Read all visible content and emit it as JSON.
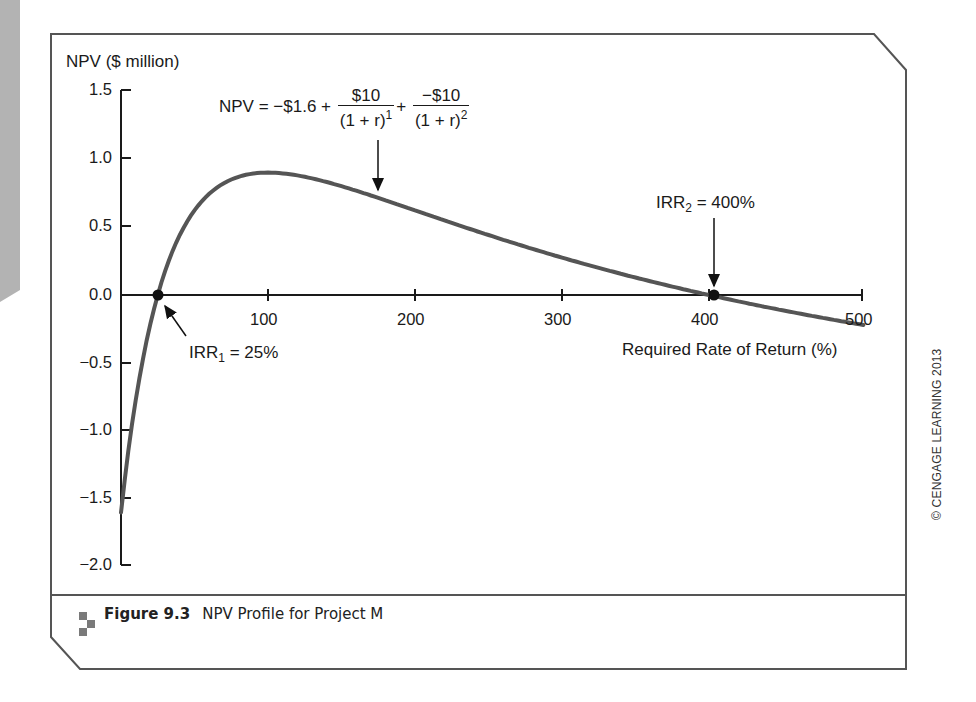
{
  "figure": {
    "number_label": "Figure 9.3",
    "caption": "NPV Profile for Project M",
    "credit": "© CENGAGE LEARNING 2013"
  },
  "formula": {
    "lhs": "NPV = −$1.6 +",
    "term1_num": "$10",
    "term1_den": "(1 + r)",
    "term1_exp": "1",
    "plus": "+",
    "term2_num": "−$10",
    "term2_den": "(1 + r)",
    "term2_exp": "2"
  },
  "annotations": {
    "irr1_prefix": "IRR",
    "irr1_sub": "1",
    "irr1_suffix": " = 25%",
    "irr2_prefix": "IRR",
    "irr2_sub": "2",
    "irr2_suffix": " = 400%"
  },
  "axes": {
    "ylabel": "NPV ($ million)",
    "xlabel": "Required Rate of Return (%)",
    "yticks": [
      "1.5",
      "1.0",
      "0.5",
      "0.0",
      "−0.5",
      "−1.0",
      "−1.5",
      "−2.0"
    ],
    "xticks": [
      "100",
      "200",
      "300",
      "400",
      "500"
    ]
  },
  "chart_data": {
    "type": "line",
    "title": "NPV Profile for Project M",
    "xlabel": "Required Rate of Return (%)",
    "ylabel": "NPV ($ million)",
    "xlim": [
      0,
      500
    ],
    "ylim": [
      -2.0,
      1.5
    ],
    "xticks": [
      100,
      200,
      300,
      400,
      500
    ],
    "yticks": [
      1.5,
      1.0,
      0.5,
      0.0,
      -0.5,
      -1.0,
      -1.5,
      -2.0
    ],
    "grid": false,
    "legend": null,
    "formula": "NPV = -1.6 + 10/(1+r)^1 + -10/(1+r)^2",
    "series": [
      {
        "name": "NPV",
        "x": [
          0,
          10,
          25,
          50,
          75,
          100,
          150,
          200,
          250,
          300,
          350,
          400,
          450,
          500
        ],
        "values": [
          -1.6,
          -0.777,
          0.0,
          0.622,
          0.845,
          0.9,
          0.8,
          0.622,
          0.48,
          0.275,
          0.133,
          0.0,
          -0.123,
          -0.211
        ]
      }
    ],
    "annotations": [
      {
        "text": "IRR1 = 25%",
        "x": 25,
        "y": 0.0
      },
      {
        "text": "IRR2 = 400%",
        "x": 400,
        "y": 0.0
      },
      {
        "text": "NPV = −$1.6 + $10/(1 + r)^1 + −$10/(1 + r)^2",
        "x": 175,
        "y": 0.7
      }
    ]
  }
}
